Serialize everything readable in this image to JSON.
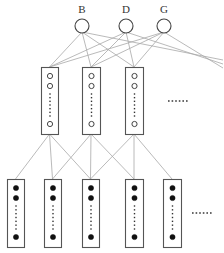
{
  "diagram": {
    "title": "",
    "colors": {
      "edge": "#a8a8a8",
      "node_stroke": "#444444",
      "box_stroke": "#555555",
      "filled_unit": "#111111",
      "label": "#333333"
    },
    "top_nodes": [
      {
        "id": "B",
        "label": "B",
        "cx": 82,
        "cy": 26,
        "r": 7
      },
      {
        "id": "D",
        "label": "D",
        "cx": 126,
        "cy": 26,
        "r": 7
      },
      {
        "id": "G",
        "label": "G",
        "cx": 164,
        "cy": 26,
        "r": 7
      }
    ],
    "middle_boxes": [
      {
        "id": "m1",
        "x": 41,
        "y": 67,
        "w": 17,
        "h": 67,
        "unit_style": "open"
      },
      {
        "id": "m2",
        "x": 82,
        "y": 67,
        "w": 18,
        "h": 67,
        "unit_style": "open"
      },
      {
        "id": "m3",
        "x": 125,
        "y": 67,
        "w": 18,
        "h": 67,
        "unit_style": "open"
      }
    ],
    "middle_ellipsis": {
      "text": "......",
      "x": 168,
      "y": 101
    },
    "bottom_boxes": [
      {
        "id": "b1",
        "x": 7,
        "y": 179,
        "w": 17,
        "h": 68,
        "unit_style": "filled"
      },
      {
        "id": "b2",
        "x": 44,
        "y": 179,
        "w": 17,
        "h": 68,
        "unit_style": "filled"
      },
      {
        "id": "b3",
        "x": 82,
        "y": 179,
        "w": 17,
        "h": 68,
        "unit_style": "filled"
      },
      {
        "id": "b4",
        "x": 125,
        "y": 179,
        "w": 18,
        "h": 68,
        "unit_style": "filled"
      },
      {
        "id": "b5",
        "x": 163,
        "y": 179,
        "w": 18,
        "h": 68,
        "unit_style": "filled"
      }
    ],
    "bottom_ellipsis": {
      "text": "......",
      "x": 192,
      "y": 213
    },
    "edges_top_to_middle": [
      {
        "from": "B",
        "to": "m1"
      },
      {
        "from": "B",
        "to": "m2"
      },
      {
        "from": "B",
        "to": "m3"
      },
      {
        "from": "B",
        "to": "offscreen"
      },
      {
        "from": "D",
        "to": "m1"
      },
      {
        "from": "D",
        "to": "m2"
      },
      {
        "from": "D",
        "to": "m3"
      },
      {
        "from": "D",
        "to": "offscreen"
      },
      {
        "from": "G",
        "to": "m1"
      },
      {
        "from": "G",
        "to": "m2"
      },
      {
        "from": "G",
        "to": "m3"
      },
      {
        "from": "G",
        "to": "offscreen"
      }
    ],
    "edges_middle_to_bottom": [
      {
        "from": "m1",
        "to": "b1"
      },
      {
        "from": "m1",
        "to": "b2"
      },
      {
        "from": "m1",
        "to": "b3"
      },
      {
        "from": "m2",
        "to": "b2"
      },
      {
        "from": "m2",
        "to": "b3"
      },
      {
        "from": "m2",
        "to": "b4"
      },
      {
        "from": "m3",
        "to": "b3"
      },
      {
        "from": "m3",
        "to": "b4"
      },
      {
        "from": "m3",
        "to": "b5"
      }
    ]
  }
}
